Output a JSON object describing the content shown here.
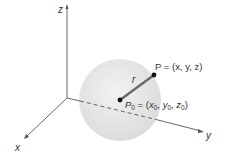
{
  "diagram": {
    "axes": {
      "x_label": "x",
      "y_label": "y",
      "z_label": "z"
    },
    "sphere": {
      "radius_label": "r",
      "point_label": "P = (x, y, z)",
      "center_label_base": "P",
      "center_label_sub": "0",
      "center_label_rest": "= (x",
      "center_coords": [
        "x",
        "y",
        "z"
      ],
      "center_sub": "0"
    },
    "colors": {
      "sphere": "#e6e6e6",
      "axis": "#555555",
      "radius": "#666666",
      "point": "#111111"
    }
  }
}
